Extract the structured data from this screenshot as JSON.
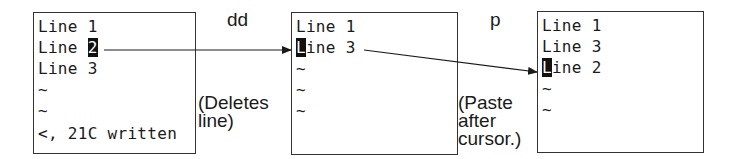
{
  "diagram": {
    "colors": {
      "ink": "#1a1a1a",
      "border": "#333333",
      "cursor_bg": "#111111",
      "background": "#ffffff"
    },
    "screens": [
      {
        "id": "before",
        "lines": [
          {
            "before": "Line ",
            "cursor": "",
            "text_after": "1"
          },
          {
            "before": "Line ",
            "cursor": "2",
            "text_after": ""
          },
          {
            "before": "Line ",
            "cursor": "",
            "text_after": "3"
          },
          {
            "before": "~",
            "cursor": "",
            "text_after": ""
          },
          {
            "before": "~",
            "cursor": "",
            "text_after": ""
          },
          {
            "before": "<, 21C written",
            "cursor": "",
            "text_after": ""
          }
        ]
      },
      {
        "id": "after-dd",
        "lines": [
          {
            "before": "Line 1",
            "cursor": "",
            "text_after": ""
          },
          {
            "before": "",
            "cursor": "L",
            "text_after": "ine 3"
          },
          {
            "before": "~",
            "cursor": "",
            "text_after": ""
          },
          {
            "before": "~",
            "cursor": "",
            "text_after": ""
          },
          {
            "before": "~",
            "cursor": "",
            "text_after": ""
          }
        ]
      },
      {
        "id": "after-p",
        "lines": [
          {
            "before": "Line 1",
            "cursor": "",
            "text_after": ""
          },
          {
            "before": "Line 3",
            "cursor": "",
            "text_after": ""
          },
          {
            "before": "",
            "cursor": "L",
            "text_after": "ine 2"
          },
          {
            "before": "~",
            "cursor": "",
            "text_after": ""
          },
          {
            "before": "~",
            "cursor": "",
            "text_after": ""
          }
        ]
      }
    ],
    "commands": [
      {
        "key": "dd",
        "description": "(Deletes\nline)"
      },
      {
        "key": "p",
        "description": "(Paste\nafter\ncursor.)"
      }
    ]
  }
}
